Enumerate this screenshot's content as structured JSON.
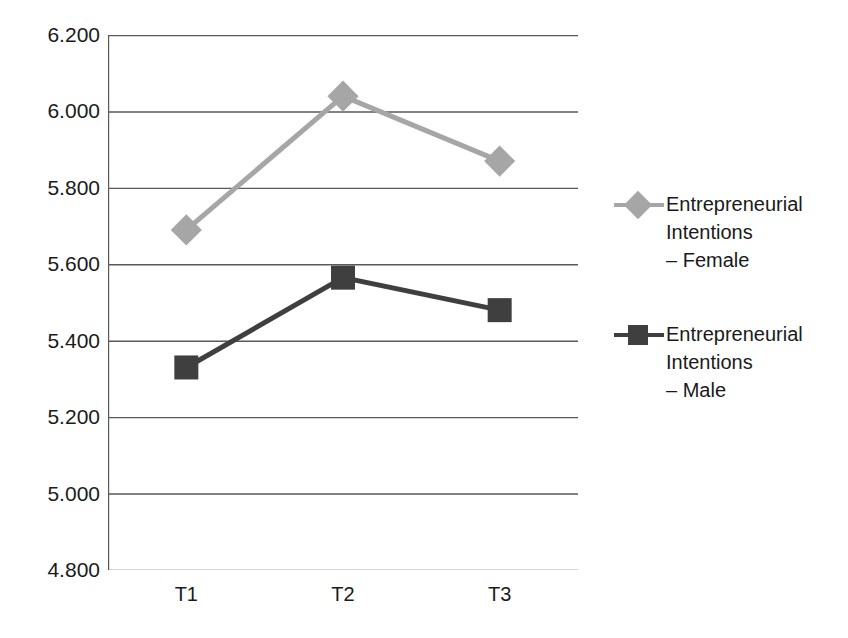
{
  "chart_data": {
    "type": "line",
    "title": "",
    "xlabel": "",
    "ylabel": "",
    "categories": [
      "T1",
      "T2",
      "T3"
    ],
    "ylim": [
      4.8,
      6.2
    ],
    "ytick_labels": [
      "6.200",
      "6.000",
      "5.800",
      "5.600",
      "5.400",
      "5.200",
      "5.000",
      "4.800"
    ],
    "ytick_values": [
      6.2,
      6.0,
      5.8,
      5.6,
      5.4,
      5.2,
      5.0,
      4.8
    ],
    "grid": "horizontal",
    "legend_position": "right",
    "series": [
      {
        "name": "Entrepreneurial Intentions\n– Female",
        "values": [
          5.69,
          6.04,
          5.87
        ],
        "color": "#a6a6a6",
        "marker": "diamond"
      },
      {
        "name": "Entrepreneurial Intentions\n– Male",
        "values": [
          5.33,
          5.565,
          5.48
        ],
        "color": "#3f3f3f",
        "marker": "square"
      }
    ]
  },
  "axis": {
    "axis_color": "#595959",
    "grid_color": "#595959"
  }
}
